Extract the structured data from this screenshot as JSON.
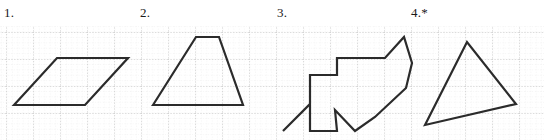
{
  "page": {
    "width": 544,
    "height": 140,
    "background_color": "#ffffff"
  },
  "grid": {
    "line_color_major": "#b9b9b9",
    "line_color_minor": "#d8d8d8",
    "major_spacing_px": 27,
    "minor_spacing_px": 5.4,
    "style": "dotted",
    "origin_x": 6,
    "origin_y": 32,
    "top": 26,
    "bottom": 140,
    "left": 0,
    "right": 544
  },
  "stroke": {
    "color": "#2b2b2b",
    "width": 2.2,
    "linejoin": "miter",
    "linecap": "butt"
  },
  "panels": [
    {
      "id": "panel-1",
      "label": "1.",
      "label_x": 4,
      "label_y": 6,
      "shape_name": "parallelogram",
      "closed": true,
      "points": [
        [
          14,
          105
        ],
        [
          57,
          58
        ],
        [
          128,
          58
        ],
        [
          85,
          105
        ]
      ]
    },
    {
      "id": "panel-2",
      "label": "2.",
      "label_x": 140,
      "label_y": 6,
      "shape_name": "trapezoid",
      "closed": true,
      "points": [
        [
          153,
          105
        ],
        [
          196,
          37
        ],
        [
          219,
          37
        ],
        [
          243,
          105
        ]
      ]
    },
    {
      "id": "panel-3",
      "label": "3.",
      "label_x": 277,
      "label_y": 6,
      "shape_name": "irregular-concave-polygon",
      "closed": true,
      "points": [
        [
          283,
          131
        ],
        [
          310,
          104
        ],
        [
          310,
          75
        ],
        [
          337,
          75
        ],
        [
          337,
          58
        ],
        [
          385,
          58
        ],
        [
          404,
          37
        ],
        [
          412,
          63
        ],
        [
          406,
          88
        ],
        [
          375,
          117
        ],
        [
          355,
          131
        ],
        [
          335,
          110
        ],
        [
          337,
          131
        ],
        [
          310,
          131
        ],
        [
          310,
          104
        ]
      ]
    },
    {
      "id": "panel-4",
      "label": "4.*",
      "label_x": 411,
      "label_y": 6,
      "shape_name": "triangle",
      "closed": true,
      "points": [
        [
          425,
          125
        ],
        [
          467,
          42
        ],
        [
          516,
          104
        ]
      ]
    }
  ]
}
